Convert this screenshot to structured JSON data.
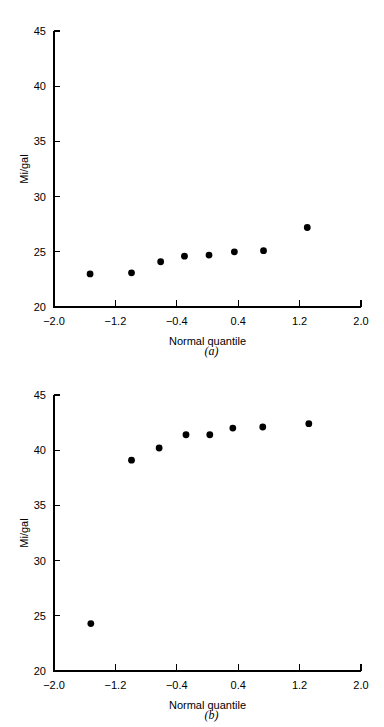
{
  "figure": {
    "background_color": "#ffffff",
    "ink_color": "#000000"
  },
  "chart_data": [
    {
      "id": "panel-a",
      "type": "scatter",
      "title": "",
      "caption": "(a)",
      "xlabel": "Normal quantile",
      "ylabel": "Mi/gal",
      "xlim": [
        -2.0,
        2.0
      ],
      "ylim": [
        20,
        45
      ],
      "xticks": [
        -2.0,
        -1.2,
        -0.4,
        0.4,
        1.2,
        2.0
      ],
      "xticklabels": [
        "−2.0",
        "−1.2",
        "−0.4",
        "0.4",
        "1.2",
        "2.0"
      ],
      "yticks": [
        20,
        25,
        30,
        35,
        40,
        45
      ],
      "yticklabels": [
        "20",
        "25",
        "30",
        "35",
        "40",
        "45"
      ],
      "grid": false,
      "legend": "none",
      "marker": "filled-circle",
      "marker_color": "#000000",
      "points": [
        {
          "x": -1.53,
          "y": 23.0
        },
        {
          "x": -0.99,
          "y": 23.1
        },
        {
          "x": -0.61,
          "y": 24.1
        },
        {
          "x": -0.3,
          "y": 24.6
        },
        {
          "x": 0.02,
          "y": 24.7
        },
        {
          "x": 0.35,
          "y": 25.0
        },
        {
          "x": 0.73,
          "y": 25.1
        },
        {
          "x": 1.3,
          "y": 27.2
        }
      ]
    },
    {
      "id": "panel-b",
      "type": "scatter",
      "title": "",
      "caption": "(b)",
      "xlabel": "Normal quantile",
      "ylabel": "Mi/gal",
      "xlim": [
        -2.0,
        2.0
      ],
      "ylim": [
        20,
        45
      ],
      "xticks": [
        -2.0,
        -1.2,
        -0.4,
        0.4,
        1.2,
        2.0
      ],
      "xticklabels": [
        "−2.0",
        "−1.2",
        "−0.4",
        "0.4",
        "1.2",
        "2.0"
      ],
      "yticks": [
        20,
        25,
        30,
        35,
        40,
        45
      ],
      "yticklabels": [
        "20",
        "25",
        "30",
        "35",
        "40",
        "45"
      ],
      "grid": false,
      "legend": "none",
      "marker": "filled-circle",
      "marker_color": "#000000",
      "points": [
        {
          "x": -1.52,
          "y": 24.3
        },
        {
          "x": -0.99,
          "y": 39.1
        },
        {
          "x": -0.63,
          "y": 40.2
        },
        {
          "x": -0.28,
          "y": 41.4
        },
        {
          "x": 0.03,
          "y": 41.4
        },
        {
          "x": 0.33,
          "y": 42.0
        },
        {
          "x": 0.72,
          "y": 42.1
        },
        {
          "x": 1.32,
          "y": 42.4
        }
      ]
    }
  ]
}
